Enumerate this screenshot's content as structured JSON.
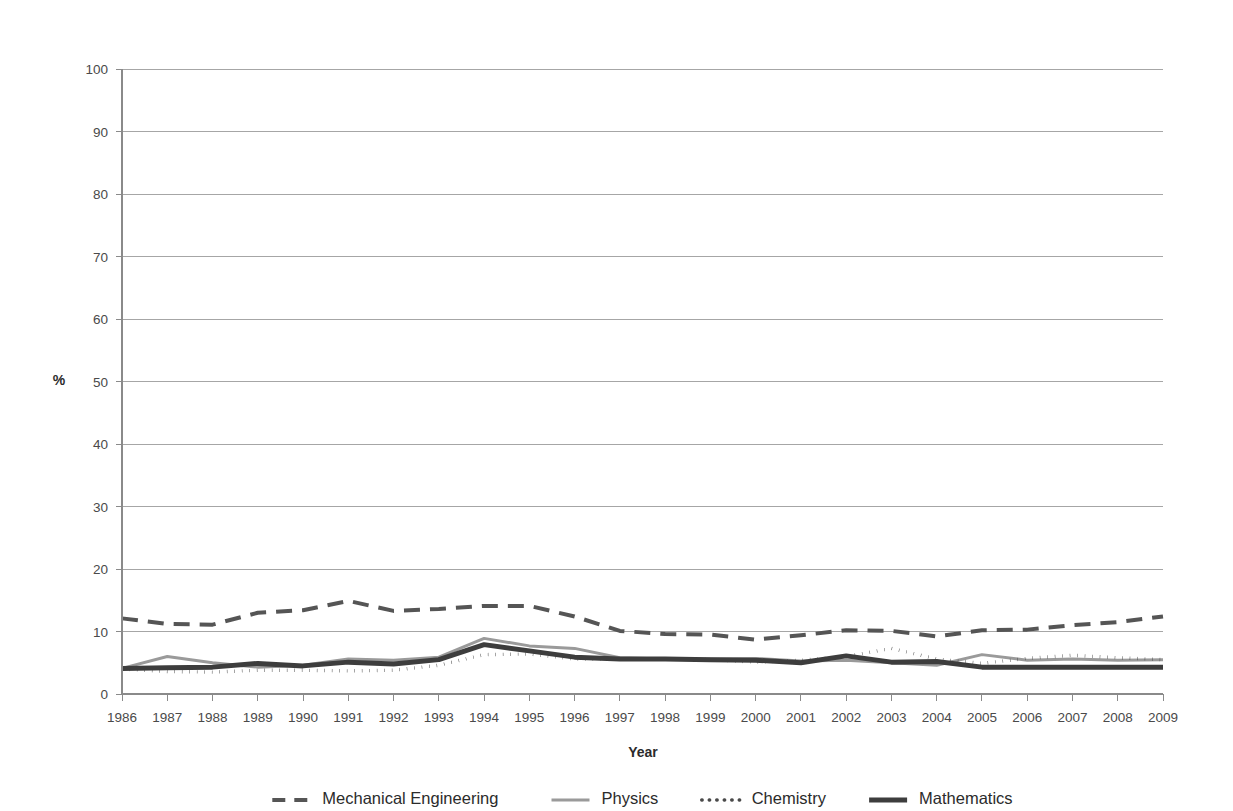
{
  "chart_data": {
    "type": "line",
    "title": "",
    "xlabel": "Year",
    "ylabel": "%",
    "ylim": [
      0,
      100
    ],
    "ytick_step": 10,
    "yticks": [
      0,
      10,
      20,
      30,
      40,
      50,
      60,
      70,
      80,
      90,
      100
    ],
    "grid": true,
    "legend_position": "bottom",
    "categories": [
      "1986",
      "1987",
      "1988",
      "1989",
      "1990",
      "1991",
      "1992",
      "1993",
      "1994",
      "1995",
      "1996",
      "1997",
      "1998",
      "1999",
      "2000",
      "2001",
      "2002",
      "2003",
      "2004",
      "2005",
      "2006",
      "2007",
      "2008",
      "2009"
    ],
    "series": [
      {
        "name": "Mechanical Engineering",
        "color": "#555555",
        "style": "dashed",
        "width": 4,
        "values": [
          12.1,
          11.2,
          11.1,
          13.0,
          13.4,
          14.9,
          13.3,
          13.6,
          14.1,
          14.1,
          12.4,
          10.1,
          9.6,
          9.5,
          8.7,
          9.4,
          10.2,
          10.1,
          9.2,
          10.2,
          10.3,
          11.0,
          11.5,
          12.4
        ]
      },
      {
        "name": "Physics",
        "color": "#9a9a9a",
        "style": "solid",
        "width": 3,
        "values": [
          4.1,
          6.0,
          5.0,
          4.3,
          4.6,
          5.6,
          5.4,
          5.9,
          8.9,
          7.7,
          7.3,
          5.8,
          5.6,
          5.6,
          5.7,
          5.3,
          5.4,
          5.0,
          4.6,
          6.3,
          5.4,
          5.6,
          5.4,
          5.5
        ]
      },
      {
        "name": "Chemistry",
        "color": "#4a4a4a",
        "style": "dotted",
        "width": 3.4,
        "values": [
          4.0,
          3.6,
          3.5,
          3.8,
          3.8,
          3.7,
          3.8,
          4.6,
          6.3,
          6.4,
          5.6,
          5.6,
          5.6,
          5.5,
          5.1,
          5.4,
          6.0,
          7.3,
          5.6,
          4.9,
          5.7,
          6.2,
          5.8,
          5.5
        ]
      },
      {
        "name": "Mathematics",
        "color": "#3d3d3d",
        "style": "solid-thick",
        "width": 5,
        "values": [
          4.1,
          4.2,
          4.3,
          4.9,
          4.5,
          5.1,
          4.8,
          5.5,
          7.9,
          6.9,
          5.9,
          5.6,
          5.6,
          5.5,
          5.4,
          5.0,
          6.1,
          5.1,
          5.2,
          4.3,
          4.3,
          4.3,
          4.3,
          4.3
        ]
      }
    ]
  },
  "legend": {
    "entries": [
      {
        "label": "Mechanical Engineering"
      },
      {
        "label": "Physics"
      },
      {
        "label": "Chemistry"
      },
      {
        "label": "Mathematics"
      }
    ]
  },
  "axis": {
    "x_title": "Year",
    "y_title": "%"
  }
}
